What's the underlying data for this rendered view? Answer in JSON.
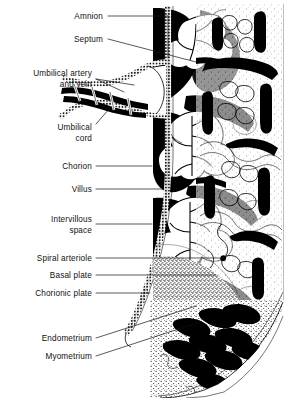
{
  "figure": {
    "type": "anatomical-illustration",
    "style": "black-and-white line engraving with stipple shading",
    "background_color": "#ffffff",
    "ink_color": "#000000"
  },
  "labels": [
    {
      "id": "amnion",
      "text": "Amnion",
      "text_x": 103,
      "text_y": 19,
      "anchor": "end",
      "lines": [
        [
          108,
          16,
          168,
          16
        ],
        [
          168,
          16,
          168,
          58
        ]
      ]
    },
    {
      "id": "septum",
      "text": "Septum",
      "text_x": 103,
      "text_y": 42,
      "anchor": "end",
      "lines": [
        [
          108,
          39,
          196,
          62
        ]
      ]
    },
    {
      "id": "umbilical-vessels-line1",
      "text": "Umbilical artery",
      "text_x": 92,
      "text_y": 76,
      "anchor": "end",
      "lines": [
        [
          96,
          79,
          124,
          92
        ]
      ]
    },
    {
      "id": "umbilical-vessels-line2",
      "text": "and vein",
      "text_x": 92,
      "text_y": 87,
      "anchor": "end",
      "lines": [
        [
          96,
          79,
          134,
          85
        ]
      ]
    },
    {
      "id": "umbilical-cord-line1",
      "text": "Umbilical",
      "text_x": 92,
      "text_y": 130,
      "anchor": "end",
      "lines": [
        [
          96,
          124,
          110,
          108
        ]
      ]
    },
    {
      "id": "umbilical-cord-line2",
      "text": "cord",
      "text_x": 92,
      "text_y": 141,
      "anchor": "end",
      "lines": []
    },
    {
      "id": "chorion",
      "text": "Chorion",
      "text_x": 92,
      "text_y": 169,
      "anchor": "end",
      "lines": [
        [
          96,
          166,
          152,
          166
        ]
      ]
    },
    {
      "id": "villus",
      "text": "Villus",
      "text_x": 92,
      "text_y": 192,
      "anchor": "end",
      "lines": [
        [
          96,
          189,
          164,
          189
        ]
      ]
    },
    {
      "id": "intervillous-line1",
      "text": "Intervillous",
      "text_x": 92,
      "text_y": 222,
      "anchor": "end",
      "lines": [
        [
          96,
          224,
          152,
          224
        ]
      ]
    },
    {
      "id": "intervillous-line2",
      "text": "space",
      "text_x": 92,
      "text_y": 233,
      "anchor": "end",
      "lines": []
    },
    {
      "id": "spiral-arteriole",
      "text": "Spiral arteriole",
      "text_x": 92,
      "text_y": 261,
      "anchor": "end",
      "lines": [
        [
          96,
          258,
          224,
          258
        ]
      ]
    },
    {
      "id": "basal-plate",
      "text": "Basal plate",
      "text_x": 92,
      "text_y": 278,
      "anchor": "end",
      "lines": [
        [
          96,
          275,
          216,
          275
        ]
      ]
    },
    {
      "id": "chorionic-plate",
      "text": "Chorionic plate",
      "text_x": 92,
      "text_y": 296,
      "anchor": "end",
      "lines": [
        [
          96,
          293,
          150,
          293
        ]
      ]
    },
    {
      "id": "endometrium",
      "text": "Endometrium",
      "text_x": 92,
      "text_y": 341,
      "anchor": "end",
      "lines": [
        [
          96,
          338,
          196,
          306
        ]
      ]
    },
    {
      "id": "myometrium",
      "text": "Myometrium",
      "text_x": 92,
      "text_y": 359,
      "anchor": "end",
      "lines": [
        [
          96,
          356,
          200,
          322
        ]
      ]
    }
  ],
  "structures": [
    {
      "id": "amnion-membrane",
      "name": "amnion",
      "description": "beaded vertical membrane at left margin of placental disc"
    },
    {
      "id": "chorionic-plate-band",
      "name": "chorionic plate",
      "description": "stippled band curving down the left side of the placenta"
    },
    {
      "id": "umbilical-cord-body",
      "name": "umbilical cord",
      "description": "coiled cord entering from the left with artery and vein"
    },
    {
      "id": "villous-tree",
      "name": "chorionic villi",
      "description": "branching tree-like villi filling the intervillous space"
    },
    {
      "id": "intervillous-space",
      "name": "intervillous space",
      "description": "dark maternal blood lakes surrounding the villi"
    },
    {
      "id": "septum-wall",
      "name": "placental septum",
      "description": "partition dividing adjacent cotyledons"
    },
    {
      "id": "basal-plate-zone",
      "name": "basal plate",
      "description": "stippled maternal surface of the placenta"
    },
    {
      "id": "spiral-arterioles",
      "name": "spiral arterioles",
      "description": "coiled maternal vessels opening into the intervillous space"
    },
    {
      "id": "endometrium-layer",
      "name": "endometrium",
      "description": "decidual layer with stippled texture and vessel profiles"
    },
    {
      "id": "myometrium-layer",
      "name": "myometrium",
      "description": "outermost uterine muscle layer with elongated vessels"
    }
  ]
}
